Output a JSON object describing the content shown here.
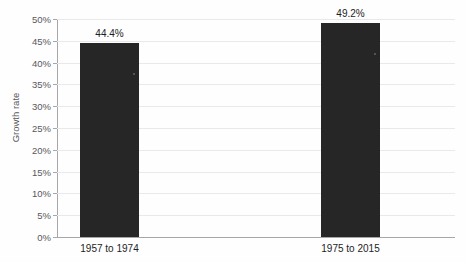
{
  "chart_data": {
    "type": "bar",
    "title": "",
    "xlabel": "",
    "ylabel": "Growth rate",
    "categories": [
      "1957 to 1974",
      "1975 to 2015"
    ],
    "values": [
      44.4,
      49.2
    ],
    "value_labels": [
      "44.4%",
      "49.2%"
    ],
    "ylim": [
      0,
      50
    ],
    "ytick_step": 5,
    "ytick_labels": [
      "50%",
      "45%",
      "40%",
      "35%",
      "30%",
      "25%",
      "20%",
      "15%",
      "10%",
      "5%",
      "0%"
    ],
    "ytick_values": [
      50,
      45,
      40,
      35,
      30,
      25,
      20,
      15,
      10,
      5,
      0
    ],
    "grid": true,
    "grid_axis": "y",
    "legend": false,
    "legend_position": "none",
    "series": [
      {
        "name": "Growth rate",
        "values": [
          44.4,
          49.2
        ],
        "color": "#262626"
      }
    ],
    "colors": {
      "bar": "#262626",
      "grid": "#e9e9ec",
      "axis": "#a7a7ab",
      "text": "#1d1d1f",
      "tick_text": "#58585c",
      "background": "#fefefe"
    }
  },
  "title_sliver": {
    "text": " "
  }
}
